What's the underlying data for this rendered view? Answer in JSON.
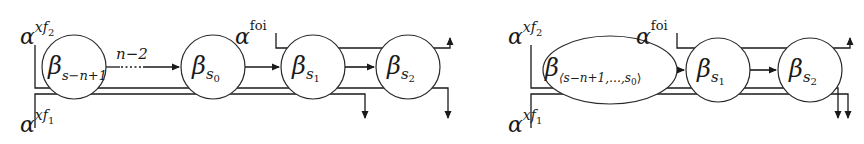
{
  "left_diagram": {
    "alpha_top": {
      "symbol": "α",
      "sup": "xf",
      "sub": "2"
    },
    "alpha_bottom": {
      "symbol": "α",
      "sup": "xf",
      "sub": "1"
    },
    "alpha_foi": {
      "symbol": "α",
      "sup": "foi"
    },
    "nodes": [
      {
        "symbol": "β",
        "sub": "s−n+1"
      },
      {
        "symbol": "β",
        "sub": "s",
        "subsub": "0"
      },
      {
        "symbol": "β",
        "sub": "s",
        "subsub": "1"
      },
      {
        "symbol": "β",
        "sub": "s",
        "subsub": "2"
      }
    ],
    "edge_label": "n−2"
  },
  "right_diagram": {
    "alpha_top": {
      "symbol": "α",
      "sup": "xf",
      "sub": "2"
    },
    "alpha_bottom": {
      "symbol": "α",
      "sup": "xf",
      "sub": "1"
    },
    "alpha_foi": {
      "symbol": "α",
      "sup": "foi"
    },
    "nodes": [
      {
        "symbol": "β",
        "sub": "⟨s−n+1,…,s",
        "subsub": "0",
        "close": "⟩"
      },
      {
        "symbol": "β",
        "sub": "s",
        "subsub": "1"
      },
      {
        "symbol": "β",
        "sub": "s",
        "subsub": "2"
      }
    ]
  }
}
